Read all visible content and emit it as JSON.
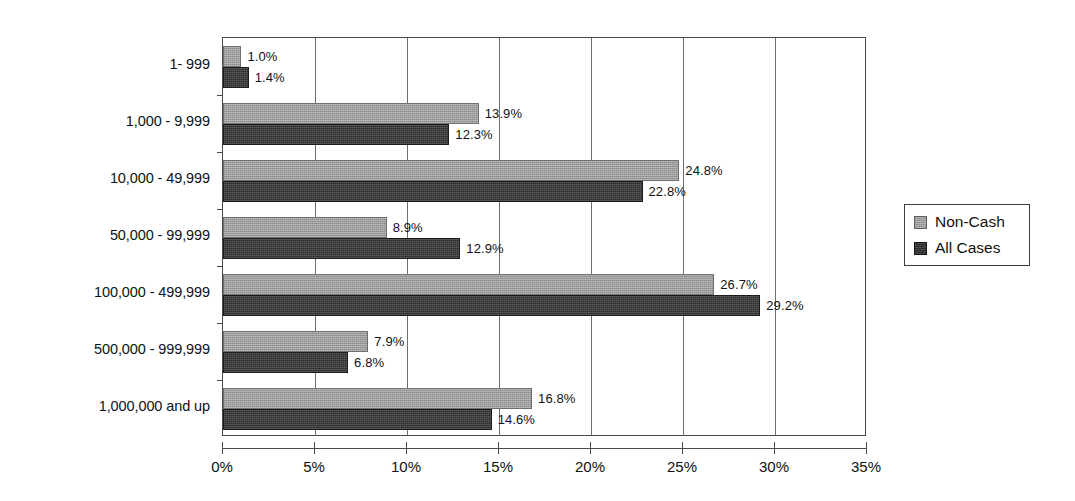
{
  "chart_data": {
    "type": "bar",
    "orientation": "horizontal",
    "title": "",
    "subtitle": "",
    "xlabel": "",
    "ylabel": "",
    "xlim": [
      0,
      35
    ],
    "xtick_labels": [
      "0%",
      "5%",
      "10%",
      "15%",
      "20%",
      "25%",
      "30%",
      "35%"
    ],
    "xtick_values": [
      0,
      5,
      10,
      15,
      20,
      25,
      30,
      35
    ],
    "grid": "vertical",
    "legend_position": "right",
    "categories": [
      "1- 999",
      "1,000 - 9,999",
      "10,000 - 49,999",
      "50,000 - 99,999",
      "100,000 - 499,999",
      "500,000 - 999,999",
      "1,000,000 and up"
    ],
    "series": [
      {
        "name": "Non-Cash",
        "color": "#9b9b9b",
        "values": [
          1.0,
          13.9,
          24.8,
          8.9,
          26.7,
          7.9,
          16.8
        ],
        "labels": [
          "1.0%",
          "13.9%",
          "24.8%",
          "8.9%",
          "26.7%",
          "7.9%",
          "16.8%"
        ]
      },
      {
        "name": "All Cases",
        "color": "#2d2d2d",
        "values": [
          1.4,
          12.3,
          22.8,
          12.9,
          29.2,
          6.8,
          14.6
        ],
        "labels": [
          "1.4%",
          "12.3%",
          "22.8%",
          "12.9%",
          "29.2%",
          "6.8%",
          "14.6%"
        ]
      }
    ]
  },
  "legend": {
    "items": [
      {
        "label": "Non-Cash",
        "swatch": "legend-swatch-non-cash"
      },
      {
        "label": "All Cases",
        "swatch": "legend-swatch-all-cases"
      }
    ]
  }
}
